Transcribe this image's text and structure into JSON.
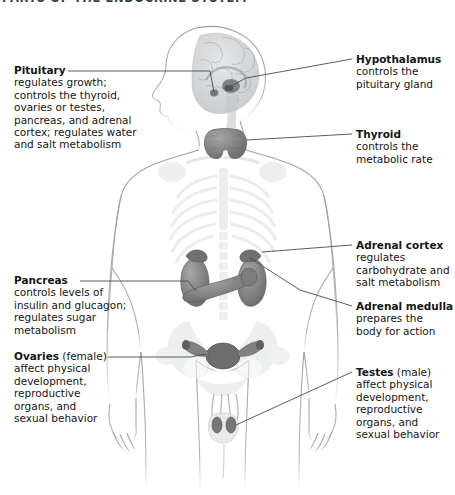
{
  "title": "PARTS OF THE ENDOCRINE SYSTEM",
  "figure": {
    "view": "anterior body with head in left profile",
    "palette": {
      "background": "#ffffff",
      "text": "#151515",
      "title": "#3a3f46",
      "leader_line": "#4a4a4a",
      "body_outline": "#9aa0a6",
      "skeleton_light": "#e8eaec",
      "organ_mid": "#8e8e8e",
      "organ_dark": "#6f6f6f",
      "brain_gray": "#b9bcbf"
    }
  },
  "callouts": {
    "pituitary": {
      "name": "Pituitary",
      "qualifier": "",
      "lines": [
        "regulates growth;",
        "controls the thyroid,",
        "ovaries or testes,",
        "pancreas, and adrenal",
        "cortex; regulates water",
        "and salt metabolism"
      ]
    },
    "pancreas": {
      "name": "Pancreas",
      "qualifier": "",
      "lines": [
        "controls levels of",
        "insulin and glucagon;",
        "regulates sugar",
        "metabolism"
      ]
    },
    "ovaries": {
      "name": "Ovaries",
      "qualifier": " (female)",
      "lines": [
        "affect physical",
        "development,",
        "reproductive",
        "organs, and",
        "sexual behavior"
      ]
    },
    "hypothalamus": {
      "name": "Hypothalamus",
      "qualifier": "",
      "lines": [
        "controls the",
        "pituitary gland"
      ]
    },
    "thyroid": {
      "name": "Thyroid",
      "qualifier": "",
      "lines": [
        "controls the",
        "metabolic rate"
      ]
    },
    "adrenal_cortex": {
      "name": "Adrenal cortex",
      "qualifier": "",
      "lines": [
        "regulates",
        "carbohydrate and",
        "salt metabolism"
      ]
    },
    "adrenal_medulla": {
      "name": "Adrenal medulla",
      "qualifier": "",
      "lines": [
        "prepares the",
        "body for action"
      ]
    },
    "testes": {
      "name": "Testes",
      "qualifier": " (male)",
      "lines": [
        "affect physical",
        "development,",
        "reproductive",
        "organs, and",
        "sexual behavior"
      ]
    }
  }
}
